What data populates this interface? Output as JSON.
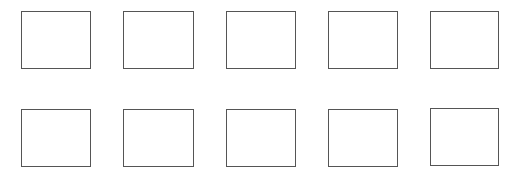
{
  "grid": {
    "rows": 2,
    "columns": 5,
    "border_color": "#555555",
    "background": "#ffffff",
    "boxes": [
      {
        "x": 21,
        "y": 11,
        "w": 70,
        "h": 58
      },
      {
        "x": 123,
        "y": 11,
        "w": 71,
        "h": 58
      },
      {
        "x": 226,
        "y": 11,
        "w": 70,
        "h": 58
      },
      {
        "x": 328,
        "y": 11,
        "w": 70,
        "h": 58
      },
      {
        "x": 430,
        "y": 11,
        "w": 69,
        "h": 58
      },
      {
        "x": 21,
        "y": 109,
        "w": 70,
        "h": 58
      },
      {
        "x": 123,
        "y": 109,
        "w": 71,
        "h": 58
      },
      {
        "x": 226,
        "y": 109,
        "w": 70,
        "h": 58
      },
      {
        "x": 328,
        "y": 109,
        "w": 70,
        "h": 58
      },
      {
        "x": 430,
        "y": 108,
        "w": 69,
        "h": 58
      }
    ]
  }
}
